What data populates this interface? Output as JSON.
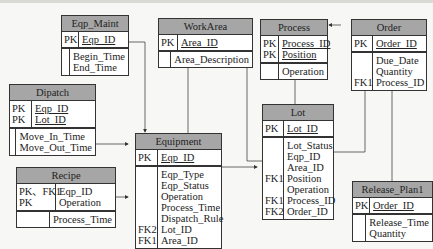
{
  "diagram": {
    "type": "ER diagram",
    "entities": {
      "eqp_maint": {
        "title": "Eqp_Maint",
        "pk_keys": "PK",
        "pk_attrs": [
          "Eqp_ID"
        ],
        "keys": "",
        "attrs": "Begin_Time\nEnd_Time"
      },
      "workarea": {
        "title": "WorkArea",
        "pk_keys": "PK",
        "pk_attrs": [
          "Area_ID"
        ],
        "keys": "",
        "attrs": "Area_Description"
      },
      "process": {
        "title": "Process",
        "pk_keys": "PK\nPK",
        "pk_attrs": [
          "Process_ID",
          "Position"
        ],
        "keys": "",
        "attrs": "Operation"
      },
      "order": {
        "title": "Order",
        "pk_keys": "PK",
        "pk_attrs": [
          "Order_ID"
        ],
        "keys": "\n\nFK1",
        "attrs": "Due_Date\nQuantity\nProcess_ID"
      },
      "dipatch": {
        "title": "Dipatch",
        "pk_keys": "PK\nPK",
        "pk_attrs": [
          "Eqp_ID",
          "Lot_ID"
        ],
        "keys": "",
        "attrs": "Move_In_Time\nMove_Out_Time"
      },
      "equipment": {
        "title": "Equipment",
        "pk_keys": "PK",
        "pk_attrs": [
          "Eqp_ID"
        ],
        "keys": "\n\n\n\n\nFK2\nFK1",
        "attrs": "Eqp_Type\nEqp_Status\nOperation\nProcess_Time\nDispatch_Rule\nLot_ID\nArea_ID"
      },
      "lot": {
        "title": "Lot",
        "pk_keys": "PK",
        "pk_attrs": [
          "Lot_ID"
        ],
        "keys": "\n\n\nFK1\n\nFK1\nFK2",
        "attrs": "Lot_Status\nEqp_ID\nArea_ID\nPosition\nOperation\nProcess_ID\nOrder_ID"
      },
      "recipe": {
        "title": "Recipe",
        "pk_keys": "PK、FK1\nPK",
        "pk_attrs": [
          "Eqp_ID",
          "Operation"
        ],
        "keys": "",
        "attrs": "Process_Time"
      },
      "release_plan1": {
        "title": "Release_Plan1",
        "pk_keys": "PK",
        "pk_attrs": [
          "Order_ID"
        ],
        "keys": "",
        "attrs": "Release_Time\nQuantity"
      }
    },
    "relationships": [
      {
        "from": "Eqp_Maint",
        "to": "Equipment"
      },
      {
        "from": "Dipatch",
        "to": "Equipment"
      },
      {
        "from": "Recipe",
        "to": "Equipment"
      },
      {
        "from": "Equipment",
        "to": "WorkArea"
      },
      {
        "from": "Equipment",
        "to": "Lot"
      },
      {
        "from": "Lot",
        "to": "WorkArea"
      },
      {
        "from": "Lot",
        "to": "Process"
      },
      {
        "from": "Lot",
        "to": "Order"
      },
      {
        "from": "Order",
        "to": "Process"
      },
      {
        "from": "Release_Plan1",
        "to": "Order"
      }
    ],
    "colors": {
      "header": "#a6a6a6",
      "border": "#333333",
      "background": "#f7f7f5"
    }
  }
}
